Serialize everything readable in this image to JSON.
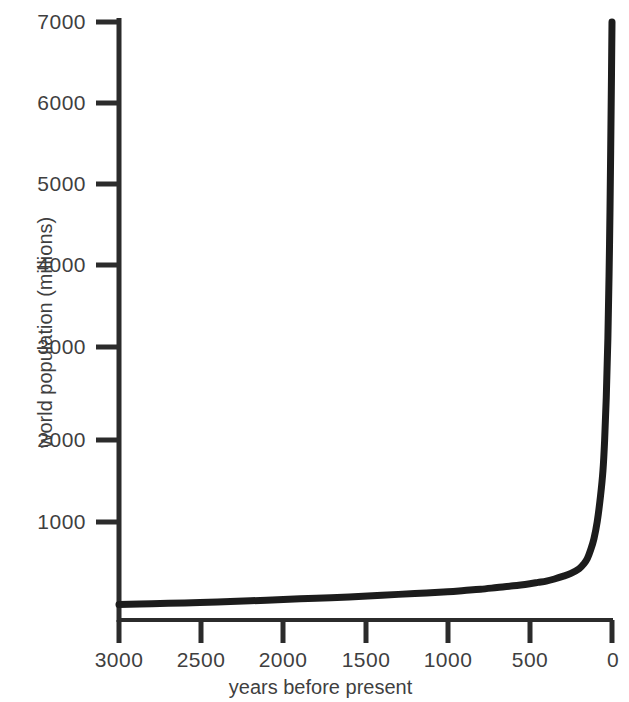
{
  "chart_data": {
    "type": "line",
    "title": "",
    "subtitle": "",
    "xlabel": "years before present",
    "ylabel": "world population (millions)",
    "xlim": [
      3000,
      0
    ],
    "ylim": [
      0,
      7000
    ],
    "x_reversed": true,
    "grid": false,
    "legend": null,
    "legend_position": "none",
    "series_color": "#1c1c1c",
    "axis_color": "#2b2b2b",
    "background": "#ffffff",
    "xticks": [
      3000,
      2500,
      2000,
      1500,
      1000,
      500,
      0
    ],
    "xtick_labels": [
      "3000",
      "2500",
      "2000",
      "1500",
      "1000",
      "500",
      "0"
    ],
    "yticks": [
      1000,
      2000,
      3000,
      4000,
      5000,
      6000,
      7000
    ],
    "ytick_labels": [
      "1000",
      "2000",
      "3000",
      "4000",
      "5000",
      "6000",
      "7000"
    ],
    "series": [
      {
        "name": "world population",
        "x": [
          3000,
          2800,
          2600,
          2400,
          2200,
          2000,
          1800,
          1600,
          1400,
          1200,
          1000,
          900,
          800,
          700,
          600,
          500,
          450,
          400,
          350,
          300,
          250,
          200,
          170,
          150,
          130,
          110,
          90,
          70,
          55,
          45,
          35,
          25,
          15,
          8,
          3,
          0
        ],
        "values": [
          180,
          190,
          200,
          210,
          225,
          240,
          255,
          270,
          290,
          310,
          330,
          345,
          360,
          380,
          400,
          425,
          440,
          455,
          480,
          510,
          545,
          600,
          660,
          720,
          820,
          950,
          1150,
          1450,
          1750,
          2100,
          2600,
          3300,
          4400,
          5500,
          6400,
          7000
        ]
      }
    ],
    "annotations": []
  },
  "axes": {
    "y_axis_name": "y-axis",
    "x_axis_name": "x-axis"
  }
}
